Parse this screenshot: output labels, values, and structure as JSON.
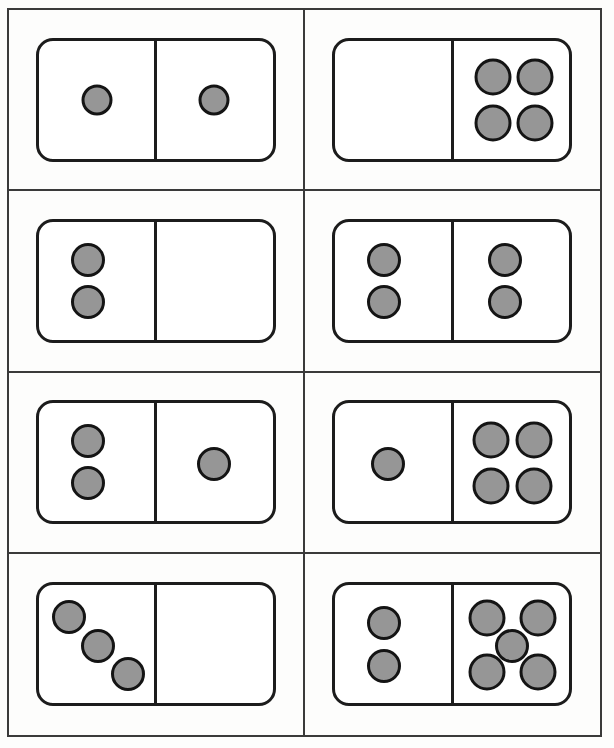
{
  "worksheet": {
    "title": "Domino dot pattern worksheet",
    "description": "Eight domino cards arranged in a 2-column by 4-row grid; each card is split into two halves containing gray dots (pips).",
    "columns": 2,
    "rows": 4,
    "background_color": "#fdfdfc",
    "grid_border_color": "#3a3a3a",
    "card_border_color": "#1c1c1c",
    "pip_fill_color": "#969696",
    "pip_border_color": "#141414"
  },
  "cards": [
    {
      "id": "domino-1",
      "position": "row 1, column 1",
      "left_count": 1,
      "right_count": 1,
      "total": 2,
      "left_pattern": "single-center",
      "right_pattern": "single-center",
      "left_pips": [
        {
          "x": 50,
          "y": 50,
          "size": "sz-s"
        }
      ],
      "right_pips": [
        {
          "x": 50,
          "y": 50,
          "size": "sz-s"
        }
      ]
    },
    {
      "id": "domino-2",
      "position": "row 1, column 2",
      "left_count": 0,
      "right_count": 4,
      "total": 4,
      "left_pattern": "empty",
      "right_pattern": "square-2x2",
      "left_pips": [],
      "right_pips": [
        {
          "x": 35,
          "y": 31,
          "size": "sz-l"
        },
        {
          "x": 71,
          "y": 31,
          "size": "sz-l"
        },
        {
          "x": 35,
          "y": 70,
          "size": "sz-l"
        },
        {
          "x": 71,
          "y": 70,
          "size": "sz-l"
        }
      ]
    },
    {
      "id": "domino-3",
      "position": "row 2, column 1",
      "left_count": 2,
      "right_count": 0,
      "total": 2,
      "left_pattern": "vertical-pair",
      "right_pattern": "empty",
      "left_pips": [
        {
          "x": 42,
          "y": 32,
          "size": "sz-m"
        },
        {
          "x": 42,
          "y": 68,
          "size": "sz-m"
        }
      ],
      "right_pips": []
    },
    {
      "id": "domino-4",
      "position": "row 2, column 2",
      "left_count": 2,
      "right_count": 2,
      "total": 4,
      "left_pattern": "vertical-pair",
      "right_pattern": "vertical-pair",
      "left_pips": [
        {
          "x": 42,
          "y": 32,
          "size": "sz-m"
        },
        {
          "x": 42,
          "y": 68,
          "size": "sz-m"
        }
      ],
      "right_pips": [
        {
          "x": 45,
          "y": 32,
          "size": "sz-m"
        },
        {
          "x": 45,
          "y": 68,
          "size": "sz-m"
        }
      ]
    },
    {
      "id": "domino-5",
      "position": "row 3, column 1",
      "left_count": 2,
      "right_count": 1,
      "total": 3,
      "left_pattern": "vertical-pair",
      "right_pattern": "single-center",
      "left_pips": [
        {
          "x": 42,
          "y": 32,
          "size": "sz-m"
        },
        {
          "x": 42,
          "y": 68,
          "size": "sz-m"
        }
      ],
      "right_pips": [
        {
          "x": 50,
          "y": 52,
          "size": "sz-m"
        }
      ]
    },
    {
      "id": "domino-6",
      "position": "row 3, column 2",
      "left_count": 1,
      "right_count": 4,
      "total": 5,
      "left_pattern": "single-center",
      "right_pattern": "square-2x2",
      "left_pips": [
        {
          "x": 45,
          "y": 52,
          "size": "sz-m"
        }
      ],
      "right_pips": [
        {
          "x": 33,
          "y": 31,
          "size": "sz-l"
        },
        {
          "x": 70,
          "y": 31,
          "size": "sz-l"
        },
        {
          "x": 33,
          "y": 70,
          "size": "sz-l"
        },
        {
          "x": 70,
          "y": 70,
          "size": "sz-l"
        }
      ]
    },
    {
      "id": "domino-7",
      "position": "row 4, column 1",
      "left_count": 3,
      "right_count": 0,
      "total": 3,
      "left_pattern": "diagonal-three",
      "right_pattern": "empty",
      "left_pips": [
        {
          "x": 26,
          "y": 27,
          "size": "sz-m"
        },
        {
          "x": 51,
          "y": 51,
          "size": "sz-m"
        },
        {
          "x": 76,
          "y": 75,
          "size": "sz-m"
        }
      ],
      "right_pips": []
    },
    {
      "id": "domino-8",
      "position": "row 4, column 2",
      "left_count": 2,
      "right_count": 5,
      "total": 7,
      "left_pattern": "vertical-pair",
      "right_pattern": "quincunx-five",
      "left_pips": [
        {
          "x": 42,
          "y": 32,
          "size": "sz-m"
        },
        {
          "x": 42,
          "y": 68,
          "size": "sz-m"
        }
      ],
      "right_pips": [
        {
          "x": 30,
          "y": 28,
          "size": "sz-l"
        },
        {
          "x": 73,
          "y": 28,
          "size": "sz-l"
        },
        {
          "x": 51,
          "y": 51,
          "size": "sz-m"
        },
        {
          "x": 30,
          "y": 73,
          "size": "sz-l"
        },
        {
          "x": 73,
          "y": 73,
          "size": "sz-l"
        }
      ]
    }
  ]
}
